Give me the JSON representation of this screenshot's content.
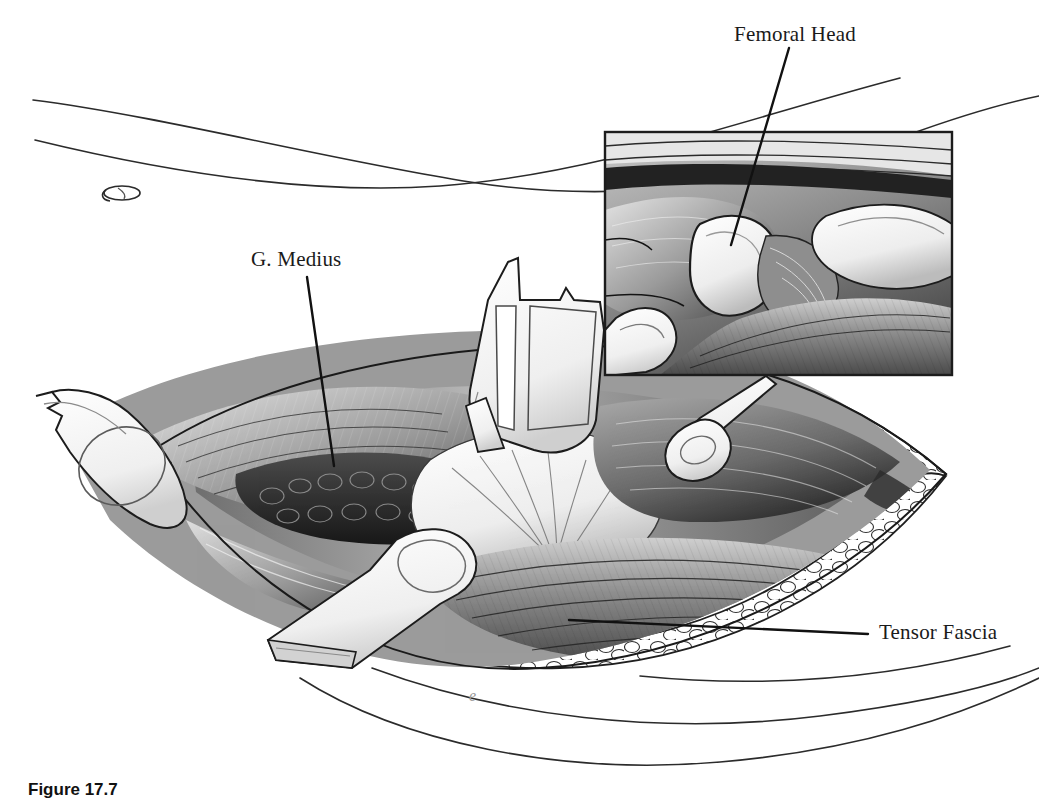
{
  "figure": {
    "type": "medical-illustration",
    "style": "grayscale pen-and-ink anatomical drawing",
    "background_color": "#ffffff",
    "ink_color": "#111111"
  },
  "labels": [
    {
      "id": "femoral-head",
      "text": "Femoral Head",
      "text_x": 734,
      "text_y": 22,
      "leader": {
        "x1": 789,
        "y1": 48,
        "x2": 731,
        "y2": 245
      }
    },
    {
      "id": "g-medius",
      "text": "G. Medius",
      "text_x": 251,
      "text_y": 247,
      "leader": {
        "x1": 307,
        "y1": 277,
        "x2": 334,
        "y2": 466
      }
    },
    {
      "id": "tensor-fascia",
      "text": "Tensor Fascia",
      "text_x": 879,
      "text_y": 620,
      "leader": {
        "x1": 569,
        "y1": 620,
        "x2": 868,
        "y2": 634
      }
    }
  ],
  "inset": {
    "name": "magnified-detail-panel",
    "x": 605,
    "y": 132,
    "width": 347,
    "height": 243,
    "border_color": "#222222",
    "content": "Close-up of femoral head exposed between retracted muscle planes"
  },
  "caption": {
    "prefix": "Figure 17.7",
    "text": "",
    "clipped": true
  },
  "artist_mark": {
    "glyph": "e",
    "x": 469,
    "y": 697
  },
  "colors": {
    "ink": "#111111",
    "muscle_mid": "#8b8b8b",
    "muscle_dark": "#3a3a3a",
    "muscle_light": "#d6d6d6",
    "fat_fill": "#ffffff",
    "retractor_fill": "#f4f4f4",
    "shadow": "#5a5a5a"
  }
}
